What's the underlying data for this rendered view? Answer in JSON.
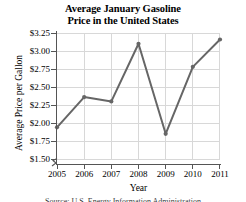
{
  "chart_data": {
    "type": "line",
    "title": "Average January Gasoline Price in the United States",
    "title_line1": "Average January Gasoline",
    "title_line2": "Price in the United States",
    "xlabel": "Year",
    "ylabel": "Average Price per Gallon",
    "categories": [
      2005,
      2006,
      2007,
      2008,
      2009,
      2010,
      2011
    ],
    "x_tick_labels": [
      "2005",
      "2006",
      "2007",
      "2008",
      "2009",
      "2010",
      "2011"
    ],
    "values": [
      1.94,
      2.36,
      2.3,
      3.1,
      1.85,
      2.78,
      3.16
    ],
    "y_tick_labels": [
      "$3.25",
      "$3.00",
      "$2.75",
      "$2.50",
      "$2.25",
      "$2.00",
      "$1.75",
      "$1.50"
    ],
    "y_tick_values": [
      3.25,
      3.0,
      2.75,
      2.5,
      2.25,
      2.0,
      1.75,
      1.5
    ],
    "ylim": [
      1.5,
      3.25
    ],
    "xlim": [
      2005,
      2011
    ],
    "y_axis_break": true,
    "grid": true,
    "legend": false,
    "series_color": "#666666",
    "grid_color": "#d8d8d8",
    "axis_color": "#555555",
    "markers": true
  },
  "footer": {
    "source_note": "Source: U.S. Energy Information Administration"
  }
}
